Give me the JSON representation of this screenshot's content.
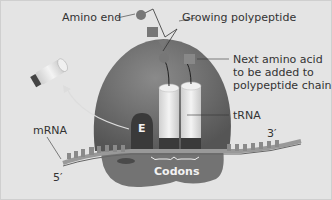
{
  "diagram": {
    "labels": {
      "amino_end": "Amino end",
      "growing_polypeptide": "Growing polypeptide",
      "next_amino_acid_line1": "Next amino acid",
      "next_amino_acid_line2": "to be added to",
      "next_amino_acid_line3": "polypeptide chain",
      "trna": "tRNA",
      "mrna": "mRNA",
      "five_prime": "5′",
      "three_prime": "3′",
      "e_site": "E",
      "codons": "Codons"
    },
    "colors": {
      "background": "#e4e4e4",
      "ribosome_large": "#6e6e6e",
      "ribosome_small": "#7a7a7a",
      "trna": "#e0e0e0",
      "e_site": "#3e3e3e",
      "text": "#333333"
    }
  }
}
